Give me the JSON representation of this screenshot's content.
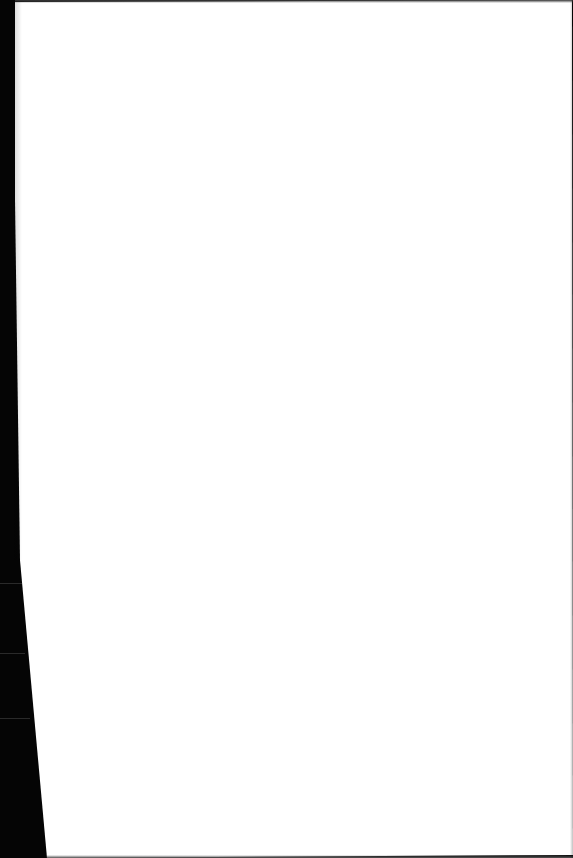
{
  "scene": {
    "description": "Photograph of a blank white sheet of paper on a dark surface",
    "paper_color": "#ffffff",
    "background_color": "#050505",
    "text_content": ""
  }
}
